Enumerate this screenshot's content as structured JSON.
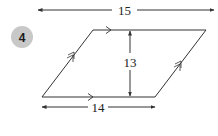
{
  "problem": {
    "number": "4",
    "badge_color": "#c8c8c8"
  },
  "shape": {
    "type": "parallelogram",
    "vertices": {
      "bottom_left": [
        42,
        97
      ],
      "bottom_right": [
        155,
        97
      ],
      "top_right": [
        206,
        30
      ],
      "top_left": [
        93,
        30
      ]
    },
    "line_color": "#333333"
  },
  "dimensions": {
    "total_width": {
      "label": "15"
    },
    "height": {
      "label": "13"
    },
    "base": {
      "label": "14"
    }
  },
  "markings": {
    "horizontal_parallel": "single-arrow",
    "slanted_parallel": "double-arrow"
  }
}
